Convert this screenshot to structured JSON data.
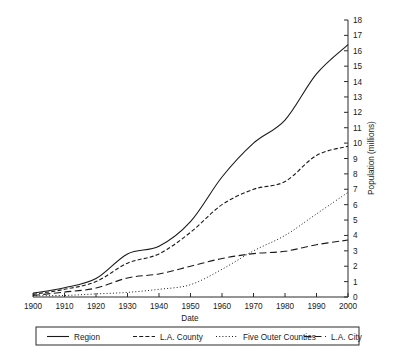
{
  "chart_data": {
    "type": "line",
    "title": "",
    "xlabel": "Date",
    "ylabel": "Population (millions)",
    "xlim": [
      1900,
      2000
    ],
    "ylim": [
      0,
      18
    ],
    "x_ticks": [
      1900,
      1910,
      1920,
      1930,
      1940,
      1950,
      1960,
      1970,
      1980,
      1990,
      2000
    ],
    "y_ticks": [
      0,
      1,
      2,
      3,
      4,
      5,
      6,
      7,
      8,
      9,
      10,
      11,
      12,
      13,
      14,
      15,
      16,
      17,
      18
    ],
    "grid": false,
    "y_axis_position": "right",
    "legend_position": "bottom",
    "x": [
      1900,
      1910,
      1920,
      1930,
      1940,
      1950,
      1960,
      1970,
      1980,
      1990,
      2000
    ],
    "series": [
      {
        "name": "Region",
        "style": "solid",
        "values": [
          0.25,
          0.6,
          1.2,
          2.8,
          3.3,
          4.9,
          7.8,
          10.0,
          11.5,
          14.5,
          16.4
        ]
      },
      {
        "name": "L.A. County",
        "style": "dashed",
        "values": [
          0.17,
          0.5,
          1.0,
          2.2,
          2.8,
          4.2,
          6.0,
          7.0,
          7.5,
          9.2,
          9.8
        ]
      },
      {
        "name": "Five Outer Counties",
        "style": "dotted",
        "values": [
          0.08,
          0.1,
          0.2,
          0.3,
          0.5,
          0.8,
          1.8,
          3.0,
          4.0,
          5.4,
          6.8
        ]
      },
      {
        "name": "L.A. City",
        "style": "longdash",
        "values": [
          0.1,
          0.32,
          0.58,
          1.24,
          1.5,
          2.0,
          2.5,
          2.82,
          2.97,
          3.4,
          3.7
        ]
      }
    ]
  },
  "axes": {
    "x_label": "Date",
    "y_label": "Population (millions)",
    "x_tick_labels": [
      "1900",
      "1910",
      "1920",
      "1930",
      "1940",
      "1950",
      "1960",
      "1970",
      "1980",
      "1990",
      "2000"
    ],
    "y_tick_labels": [
      "0",
      "1",
      "2",
      "3",
      "4",
      "5",
      "6",
      "7",
      "8",
      "9",
      "10",
      "11",
      "12",
      "13",
      "14",
      "15",
      "16",
      "17",
      "18"
    ]
  },
  "legend": {
    "items": [
      {
        "label": "Region",
        "style": "solid"
      },
      {
        "label": "L.A. County",
        "style": "dashed"
      },
      {
        "label": "Five Outer Counties",
        "style": "dotted"
      },
      {
        "label": "L.A. City",
        "style": "longdash"
      }
    ]
  },
  "colors": {
    "ink": "#1a1a1a",
    "axis": "#2b2b2b",
    "background": "#ffffff"
  }
}
